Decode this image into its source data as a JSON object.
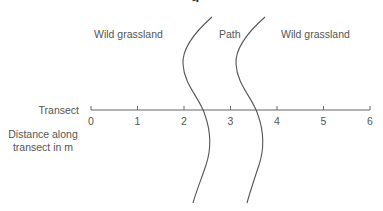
{
  "diagram": {
    "title_clipped": "g",
    "regions": [
      {
        "label": "Wild grassland",
        "x": 94,
        "y": 29
      },
      {
        "label": "Path",
        "x": 219,
        "y": 29
      },
      {
        "label": "Wild grassland",
        "x": 281,
        "y": 29
      }
    ],
    "axis": {
      "name": "Transect",
      "unit_label_line1": "Distance along",
      "unit_label_line2": "transect in m",
      "ticks": [
        "0",
        "1",
        "2",
        "3",
        "4",
        "5",
        "6"
      ],
      "tick_positions_px": [
        91,
        137.5,
        184,
        230.5,
        277,
        323.5,
        370
      ],
      "y_px": 110,
      "range_m": [
        0,
        6
      ]
    },
    "path_edges": [
      {
        "name": "left-path-edge",
        "crosses_transect_at_m": 2.4
      },
      {
        "name": "right-path-edge",
        "crosses_transect_at_m": 3.55
      }
    ],
    "colors": {
      "line": "#555555",
      "text": "#555555"
    }
  }
}
